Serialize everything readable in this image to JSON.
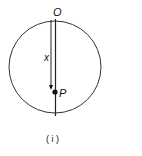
{
  "diagram": {
    "labels": {
      "top_point": "O",
      "distance": "x",
      "point": "P",
      "caption": "( i )"
    },
    "colors": {
      "stroke": "#222222",
      "background": "#ffffff"
    }
  }
}
